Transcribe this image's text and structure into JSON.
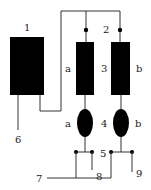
{
  "diagram": {
    "labels": {
      "n1": "1",
      "n2": "2",
      "n3": "3",
      "n4": "4",
      "n5": "5",
      "n6": "6",
      "n7": "7",
      "n8": "8",
      "n9": "9",
      "a_upper": "a",
      "b_upper": "b",
      "a_lower": "a",
      "b_lower": "b"
    },
    "colors": {
      "component": "#000000",
      "wire": "#333333"
    }
  }
}
